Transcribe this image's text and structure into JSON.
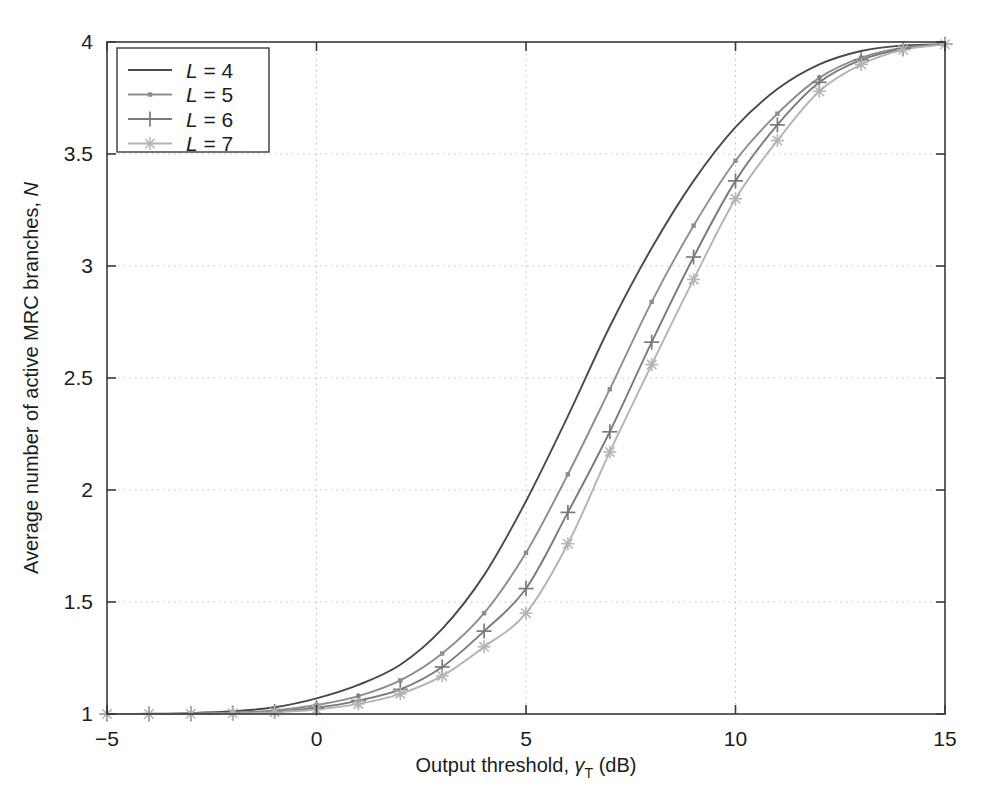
{
  "chart_data": {
    "type": "line",
    "title": "",
    "xlabel_parts": {
      "main": "Output threshold, ",
      "gamma": "γ",
      "sub": "T",
      "unit": " (dB)"
    },
    "xlabel": "Output threshold, γT (dB)",
    "ylabel": "Average number of active MRC branches, N",
    "ylabel_parts": {
      "main": "Average number of active MRC branches, ",
      "italic": "N"
    },
    "xlim": [
      -5,
      15
    ],
    "ylim": [
      1,
      4
    ],
    "xticks": [
      -5,
      0,
      5,
      10,
      15
    ],
    "xtick_labels": [
      "−5",
      "0",
      "5",
      "10",
      "15"
    ],
    "yticks": [
      1,
      1.5,
      2,
      2.5,
      3,
      3.5,
      4
    ],
    "ytick_labels": [
      "1",
      "1.5",
      "2",
      "2.5",
      "3",
      "3.5",
      "4"
    ],
    "grid": true,
    "grid_style": "dotted",
    "legend_position": "upper left",
    "x": [
      -5,
      -4,
      -3,
      -2,
      -1,
      0,
      1,
      2,
      3,
      4,
      5,
      6,
      7,
      8,
      9,
      10,
      11,
      12,
      13,
      14,
      15
    ],
    "series": [
      {
        "name": "L = 4",
        "label_italic": "L",
        "label_rest": " = 4",
        "color": "#4a4a4a",
        "marker": "none",
        "values": [
          1.0,
          1.001,
          1.004,
          1.012,
          1.03,
          1.07,
          1.13,
          1.22,
          1.38,
          1.62,
          1.95,
          2.33,
          2.73,
          3.08,
          3.38,
          3.62,
          3.79,
          3.9,
          3.96,
          3.985,
          3.99
        ]
      },
      {
        "name": "L = 5",
        "label_italic": "L",
        "label_rest": " = 5",
        "color": "#8d8d8d",
        "marker": "dot",
        "values": [
          1.0,
          1.0,
          1.002,
          1.006,
          1.016,
          1.04,
          1.08,
          1.15,
          1.27,
          1.45,
          1.72,
          2.07,
          2.45,
          2.84,
          3.18,
          3.47,
          3.68,
          3.84,
          3.93,
          3.975,
          3.99
        ]
      },
      {
        "name": "L = 6",
        "label_italic": "L",
        "label_rest": " = 6",
        "color": "#7a7a7a",
        "marker": "plus",
        "values": [
          1.0,
          1.0,
          1.001,
          1.004,
          1.011,
          1.028,
          1.06,
          1.11,
          1.21,
          1.37,
          1.56,
          1.9,
          2.26,
          2.66,
          3.04,
          3.38,
          3.63,
          3.82,
          3.92,
          3.97,
          3.99
        ]
      },
      {
        "name": "L = 7",
        "label_italic": "L",
        "label_rest": " = 7",
        "color": "#b3b3b3",
        "marker": "star",
        "values": [
          1.0,
          1.0,
          1.001,
          1.003,
          1.008,
          1.02,
          1.045,
          1.09,
          1.17,
          1.3,
          1.45,
          1.76,
          2.17,
          2.56,
          2.94,
          3.3,
          3.56,
          3.78,
          3.9,
          3.965,
          3.99
        ]
      }
    ]
  }
}
